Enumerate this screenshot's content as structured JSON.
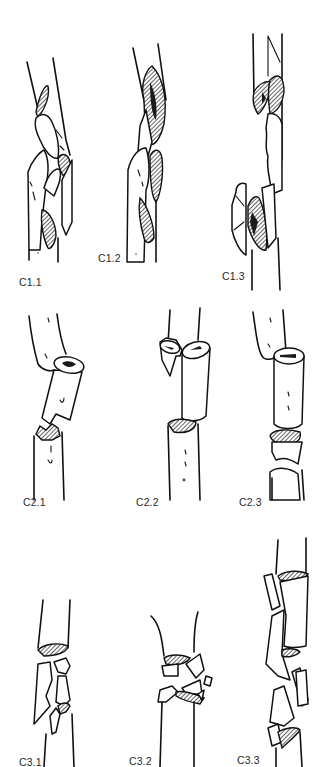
{
  "figure": {
    "type": "fracture-classification-diagram",
    "rows": [
      {
        "group": "C1",
        "panels": [
          {
            "id": "C1.1",
            "label": "C1.1"
          },
          {
            "id": "C1.2",
            "label": "C1.2"
          },
          {
            "id": "C1.3",
            "label": "C1.3"
          }
        ]
      },
      {
        "group": "C2",
        "panels": [
          {
            "id": "C2.1",
            "label": "C2.1"
          },
          {
            "id": "C2.2",
            "label": "C2.2"
          },
          {
            "id": "C2.3",
            "label": "C2.3"
          }
        ]
      },
      {
        "group": "C3",
        "panels": [
          {
            "id": "C3.1",
            "label": "C3.1"
          },
          {
            "id": "C3.2",
            "label": "C3.2"
          },
          {
            "id": "C3.3",
            "label": "C3.3"
          }
        ]
      }
    ],
    "colors": {
      "line": "#111111",
      "background": "#ffffff",
      "label": "#2a2a2a"
    }
  }
}
